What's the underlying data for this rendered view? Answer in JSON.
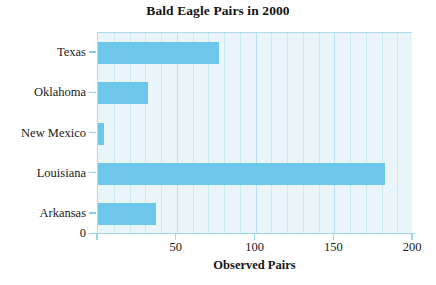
{
  "chart_data": {
    "type": "bar",
    "orientation": "horizontal",
    "title": "Bald Eagle Pairs in 2000",
    "xlabel": "Observed Pairs",
    "ylabel": "",
    "categories": [
      "Texas",
      "Oklahoma",
      "New Mexico",
      "Louisiana",
      "Arkansas"
    ],
    "values": [
      77,
      32,
      4,
      182,
      37
    ],
    "xlim": [
      0,
      200
    ],
    "xticks": [
      0,
      50,
      100,
      150,
      200
    ],
    "xtick_labels": [
      "0",
      "50",
      "100",
      "150",
      "200"
    ],
    "origin_label": "0",
    "grid": true,
    "grid_axis": "x",
    "grid_interval": 10,
    "legend": false,
    "colors": {
      "bar": "#6dc6ec",
      "plot_background": "#e9f5f8",
      "gridline": "#cbe8f1",
      "axis": "#9bd7ea",
      "text": "#1a1a1a",
      "page_background": "#ffffff"
    }
  }
}
